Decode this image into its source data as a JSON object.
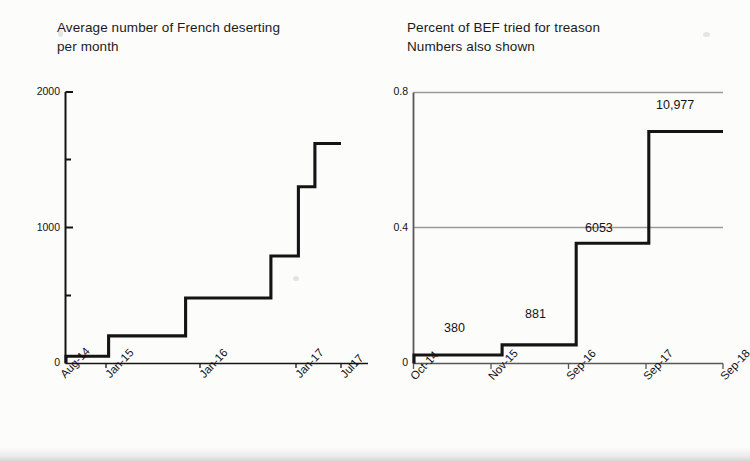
{
  "page": {
    "background_color": "#fcfcfb",
    "ink_color": "#141414",
    "grid_color": "#9a9a9a"
  },
  "charts": [
    {
      "id": "french-desertions",
      "title": "Average number of French deserting\nper month",
      "chart_data": {
        "type": "line",
        "step": true,
        "title": "Average number of French deserting per month",
        "xlabel": "",
        "ylabel": "",
        "grid": false,
        "ylim": [
          0,
          2000
        ],
        "yticks": [
          0,
          1000,
          2000
        ],
        "yticklabels": [
          "0",
          "1000",
          "2000"
        ],
        "yminorticks": [
          500,
          1500
        ],
        "xticklabels": [
          "Aug-14",
          "Jan-15",
          "Jan-16",
          "Jan-17",
          "Jul17"
        ],
        "x": [
          "Aug-14",
          "Jan-15",
          "Jan-16",
          "Jan-17",
          "Jul17"
        ],
        "categories": [
          "Aug-14",
          "Jan-15",
          "Jan-16",
          "Jan-17",
          "Jul17"
        ],
        "values": [
          50,
          200,
          480,
          790,
          1300,
          1620
        ],
        "series": [
          {
            "name": "Average deserting per month",
            "steps": [
              {
                "x_start": 0.0,
                "x_end": 0.155,
                "value": 50
              },
              {
                "x_start": 0.155,
                "x_end": 0.435,
                "value": 200
              },
              {
                "x_start": 0.435,
                "x_end": 0.745,
                "value": 480
              },
              {
                "x_start": 0.745,
                "x_end": 0.845,
                "value": 790
              },
              {
                "x_start": 0.845,
                "x_end": 0.905,
                "value": 1300
              },
              {
                "x_start": 0.905,
                "x_end": 1.0,
                "value": 1620
              }
            ]
          }
        ]
      }
    },
    {
      "id": "bef-treason",
      "title": "Percent of BEF tried for treason\nNumbers also shown",
      "chart_data": {
        "type": "line",
        "step": true,
        "title": "Percent of BEF tried for treason / Numbers also shown",
        "xlabel": "",
        "ylabel": "",
        "grid": true,
        "gridlines": [
          0.4,
          0.8
        ],
        "ylim": [
          0,
          0.8
        ],
        "yticks": [
          0,
          0.4,
          0.8
        ],
        "yticklabels": [
          "0",
          "0.4",
          "0.8"
        ],
        "xticklabels": [
          "Oct-14",
          "Nov-15",
          "Sep-16",
          "Sep-17",
          "Sep-18"
        ],
        "x": [
          "Oct-14",
          "Nov-15",
          "Sep-16",
          "Sep-17",
          "Sep-18"
        ],
        "categories": [
          "Oct-14",
          "Nov-15",
          "Sep-16",
          "Sep-17",
          "Sep-18"
        ],
        "values": [
          0.025,
          0.055,
          0.355,
          0.685
        ],
        "point_labels": [
          "380",
          "881",
          "6053",
          "10,977"
        ],
        "series": [
          {
            "name": "Percent of BEF tried for treason",
            "steps": [
              {
                "x_start": 0.0,
                "x_end": 0.285,
                "value": 0.025,
                "label": "380"
              },
              {
                "x_start": 0.285,
                "x_end": 0.525,
                "value": 0.055,
                "label": "881"
              },
              {
                "x_start": 0.525,
                "x_end": 0.76,
                "value": 0.355,
                "label": "6053"
              },
              {
                "x_start": 0.76,
                "x_end": 1.0,
                "value": 0.685,
                "label": "10,977"
              }
            ]
          }
        ]
      }
    }
  ]
}
